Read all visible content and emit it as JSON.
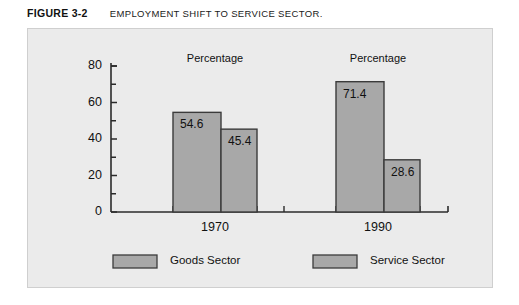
{
  "caption": {
    "figure_number": "FIGURE 3-2",
    "title": "EMPLOYMENT SHIFT TO SERVICE SECTOR."
  },
  "colors": {
    "panel_background": "#ebebeb",
    "bar_fill": "#a8a8a8",
    "bar_stroke": "#3b3b3b",
    "axis": "#2b2b2b",
    "text": "#111111"
  },
  "chart_data": {
    "type": "bar",
    "title": "EMPLOYMENT SHIFT TO SERVICE SECTOR.",
    "xlabel": "",
    "ylabel": "Percentage",
    "ylim": [
      0,
      80
    ],
    "yticks": [
      0,
      20,
      40,
      60,
      80
    ],
    "ytick_labels": [
      "0",
      "20",
      "40",
      "60",
      "80"
    ],
    "minor_tick_interval": 10,
    "grid": false,
    "legend_position": "bottom",
    "categories": [
      "1970",
      "1990"
    ],
    "group_annotations": [
      "Percentage",
      "Percentage"
    ],
    "series": [
      {
        "name": "Goods Sector",
        "values": [
          54.6,
          71.4
        ],
        "value_labels": [
          "54.6",
          "71.4"
        ]
      },
      {
        "name": "Service Sector",
        "values": [
          45.4,
          28.6
        ],
        "value_labels": [
          "45.4",
          "28.6"
        ]
      }
    ]
  },
  "legend": {
    "items": [
      {
        "label": "Goods Sector"
      },
      {
        "label": "Service Sector"
      }
    ]
  }
}
